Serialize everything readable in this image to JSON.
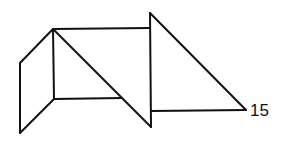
{
  "figure": {
    "label": "15",
    "stroke_color": "#111111",
    "background": "#ffffff"
  }
}
